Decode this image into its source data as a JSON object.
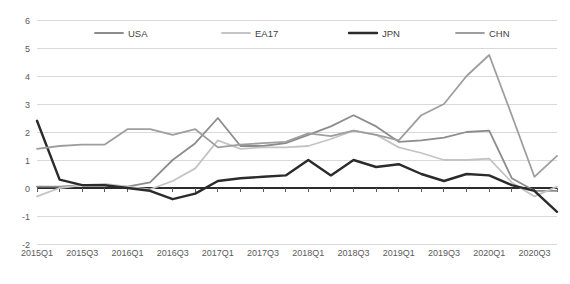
{
  "chart_data": {
    "type": "line",
    "title": "",
    "xlabel": "",
    "ylabel": "",
    "ylim": [
      -2,
      6
    ],
    "ytick_step": 1,
    "yticks": [
      "6",
      "5",
      "4",
      "3",
      "2",
      "1",
      "0",
      "-1",
      "-2"
    ],
    "grid": true,
    "legend_position": "top",
    "x": [
      "2015Q1",
      "2015Q2",
      "2015Q3",
      "2015Q4",
      "2016Q1",
      "2016Q2",
      "2016Q3",
      "2016Q4",
      "2017Q1",
      "2017Q2",
      "2017Q3",
      "2017Q4",
      "2018Q1",
      "2018Q2",
      "2018Q3",
      "2018Q4",
      "2019Q1",
      "2019Q2",
      "2019Q3",
      "2019Q4",
      "2020Q1",
      "2020Q2",
      "2020Q3",
      "2020Q4"
    ],
    "xtick_labels": [
      "2015Q1",
      "2015Q3",
      "2016Q1",
      "2016Q3",
      "2017Q1",
      "2017Q3",
      "2018Q1",
      "2018Q3",
      "2019Q1",
      "2019Q3",
      "2020Q1",
      "2020Q3"
    ],
    "xtick_indices": [
      0,
      2,
      4,
      6,
      8,
      10,
      12,
      14,
      16,
      18,
      20,
      22
    ],
    "series": [
      {
        "name": "USA",
        "color": "#8c8c8c",
        "width": 1.8,
        "values": [
          0.05,
          0.05,
          0.1,
          0.1,
          0.05,
          0.2,
          1.0,
          1.6,
          2.5,
          1.5,
          1.5,
          1.6,
          1.9,
          2.2,
          2.6,
          2.2,
          1.65,
          1.7,
          1.8,
          2.0,
          2.05,
          0.35,
          -0.1,
          -0.1
        ]
      },
      {
        "name": "EA17",
        "color": "#c4c4c4",
        "width": 1.8,
        "values": [
          -0.3,
          0.0,
          0.1,
          0.15,
          0.05,
          -0.05,
          0.25,
          0.7,
          1.7,
          1.4,
          1.45,
          1.45,
          1.5,
          1.75,
          2.05,
          1.9,
          1.45,
          1.25,
          1.0,
          1.0,
          1.05,
          0.2,
          -0.3,
          0.05
        ]
      },
      {
        "name": "JPN",
        "color": "#2b2b2b",
        "width": 2.4,
        "values": [
          2.4,
          0.3,
          0.1,
          0.1,
          0.0,
          -0.1,
          -0.4,
          -0.2,
          0.25,
          0.35,
          0.4,
          0.45,
          1.0,
          0.45,
          1.0,
          0.75,
          0.85,
          0.5,
          0.25,
          0.5,
          0.45,
          0.1,
          -0.1,
          -0.85
        ]
      },
      {
        "name": "CHN",
        "color": "#9e9e9e",
        "width": 1.8,
        "values": [
          1.4,
          1.5,
          1.55,
          1.55,
          2.1,
          2.1,
          1.9,
          2.1,
          1.45,
          1.55,
          1.6,
          1.65,
          1.95,
          1.85,
          2.05,
          1.9,
          1.7,
          2.6,
          3.0,
          4.0,
          4.75,
          2.6,
          0.4,
          1.15
        ]
      }
    ]
  }
}
